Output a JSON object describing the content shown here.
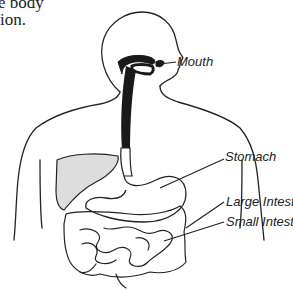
{
  "text_fragment": {
    "line1": "e body",
    "line2": "ion."
  },
  "diagram": {
    "labels": [
      {
        "id": "mouth",
        "text": "Mouth"
      },
      {
        "id": "stomach",
        "text": "Stomach"
      },
      {
        "id": "large-intestine",
        "text": "Large Intestine"
      },
      {
        "id": "small-intestine",
        "text": "Small Intestine"
      }
    ]
  }
}
